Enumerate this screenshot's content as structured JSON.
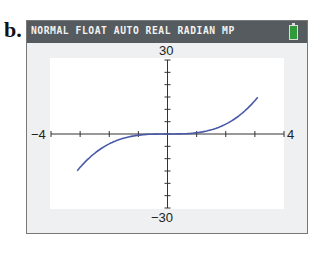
{
  "figure_label": "b.",
  "calculator": {
    "status_text": "NORMAL FLOAT AUTO REAL RADIAN MP",
    "battery_icon": "battery-full-icon",
    "battery_color": "#2f9b3a",
    "statusbar_color": "#555b5e"
  },
  "axis_labels": {
    "xmin": "−4",
    "xmax": "4",
    "ymax": "30",
    "ymin": "−30"
  },
  "chart_data": {
    "type": "line",
    "title": "",
    "xlabel": "",
    "ylabel": "",
    "xlim": [
      -4,
      4
    ],
    "ylim": [
      -30,
      30
    ],
    "xscale_tick": 1,
    "yscale_tick": 5,
    "grid": false,
    "legend": null,
    "series": [
      {
        "name": "y = 0.5x^3 (cubic)",
        "color": "#4a5aa8",
        "x": [
          -3.1,
          -2.5,
          -2,
          -1.5,
          -1,
          -0.5,
          0,
          0.5,
          1,
          1.5,
          2,
          2.5,
          3.1
        ],
        "y": [
          -29.8,
          -15.6,
          -8,
          -3.4,
          -1,
          -0.1,
          0,
          0.1,
          1,
          3.4,
          8,
          15.6,
          29.8
        ]
      }
    ]
  }
}
